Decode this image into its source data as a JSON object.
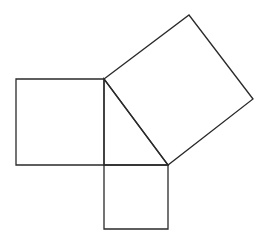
{
  "diagram": {
    "stroke_color": "#2a2a2a",
    "background": "#ffffff",
    "triangle": {
      "vertices": [
        [
          104,
          79
        ],
        [
          168,
          165
        ],
        [
          104,
          165
        ]
      ],
      "right_angle_at": [
        104,
        165
      ]
    },
    "squares": [
      {
        "name": "left-leg-square",
        "points": [
          [
            16,
            79
          ],
          [
            104,
            79
          ],
          [
            104,
            165
          ],
          [
            16,
            165
          ]
        ]
      },
      {
        "name": "bottom-leg-square",
        "points": [
          [
            104,
            165
          ],
          [
            168,
            165
          ],
          [
            168,
            229
          ],
          [
            104,
            229
          ]
        ]
      },
      {
        "name": "hypotenuse-square",
        "points": [
          [
            104,
            79
          ],
          [
            189,
            15
          ],
          [
            253,
            99
          ],
          [
            168,
            165
          ]
        ]
      }
    ]
  }
}
